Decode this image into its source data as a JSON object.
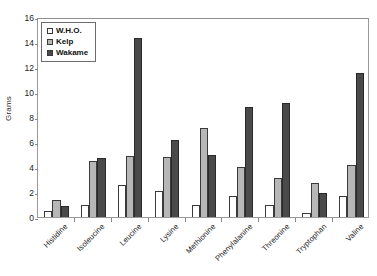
{
  "chart_data": {
    "type": "bar",
    "title": "",
    "subtitle": "",
    "xlabel": "",
    "ylabel": "Grams",
    "ylim": [
      0,
      16
    ],
    "ytick_step": 2,
    "yticks": [
      0,
      2,
      4,
      6,
      8,
      10,
      12,
      14,
      16
    ],
    "grid": false,
    "legend_position": "top-left-inside",
    "categories": [
      "Histidine",
      "Isoleucine",
      "Leucine",
      "Lysine",
      "Methionine",
      "Phenylalanine",
      "Threonine",
      "Tryptophan",
      "Valine"
    ],
    "series": [
      {
        "name": "W.H.O.",
        "color": "#ffffff",
        "values": [
          0.5,
          1.0,
          2.6,
          2.1,
          1.0,
          1.7,
          1.0,
          0.3,
          1.7
        ]
      },
      {
        "name": "Kelp",
        "color": "#b7b7b7",
        "values": [
          1.4,
          4.5,
          4.9,
          4.8,
          7.1,
          4.0,
          3.1,
          2.7,
          4.2
        ]
      },
      {
        "name": "Wakame",
        "color": "#4a4a4a",
        "values": [
          0.9,
          4.7,
          14.3,
          6.2,
          5.0,
          8.8,
          9.1,
          1.9,
          11.5
        ]
      }
    ]
  },
  "style": {
    "axis_color": "#8a8a8a",
    "text_color": "#1c1c1c",
    "plot_background": "#ffffff"
  }
}
